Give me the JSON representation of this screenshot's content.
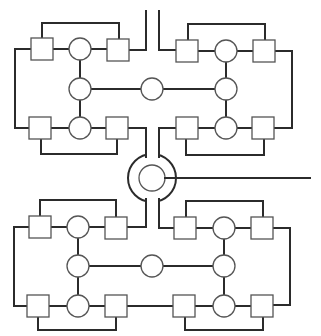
{
  "diagram": {
    "type": "network-topology",
    "colors": {
      "line": "#2b2b2b",
      "node_stroke": "#555555",
      "background": "#ffffff"
    },
    "hub": {
      "cx": 152,
      "cy": 178,
      "outer_r": 24,
      "inner_r": 13,
      "output_line_to_x": 310
    },
    "clusters": [
      {
        "id": "top-left",
        "squares": [
          [
            31,
            38
          ],
          [
            107,
            39
          ],
          [
            29,
            116
          ],
          [
            106,
            117
          ]
        ],
        "circles": [
          [
            80,
            49
          ],
          [
            80,
            89
          ],
          [
            80,
            128
          ]
        ]
      },
      {
        "id": "top-right",
        "squares": [
          [
            176,
            40
          ],
          [
            253,
            40
          ],
          [
            176,
            117
          ],
          [
            252,
            117
          ]
        ],
        "circles": [
          [
            226,
            51
          ],
          [
            226,
            89
          ],
          [
            226,
            128
          ]
        ]
      },
      {
        "id": "bottom-left",
        "squares": [
          [
            29,
            216
          ],
          [
            105,
            217
          ],
          [
            27,
            295
          ],
          [
            105,
            296
          ]
        ],
        "circles": [
          [
            78,
            227
          ],
          [
            78,
            266
          ],
          [
            78,
            306
          ]
        ]
      },
      {
        "id": "bottom-right",
        "squares": [
          [
            174,
            217
          ],
          [
            251,
            217
          ],
          [
            173,
            296
          ],
          [
            251,
            296
          ]
        ],
        "circles": [
          [
            224,
            228
          ],
          [
            224,
            266
          ],
          [
            224,
            306
          ]
        ]
      }
    ],
    "middle_circles": [
      [
        152,
        89
      ],
      [
        152,
        266
      ]
    ]
  }
}
